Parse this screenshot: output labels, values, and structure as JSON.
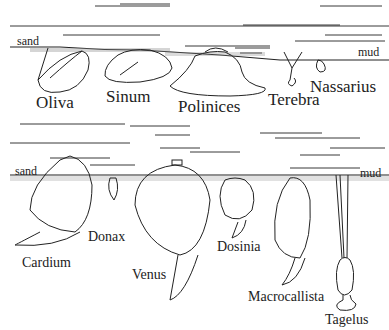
{
  "panels": [
    {
      "id": "top",
      "substrate_left": "sand",
      "substrate_right": "mud",
      "organisms": [
        {
          "name": "Oliva"
        },
        {
          "name": "Sinum"
        },
        {
          "name": "Polinices"
        },
        {
          "name": "Terebra"
        },
        {
          "name": "Nassarius"
        }
      ]
    },
    {
      "id": "bottom",
      "substrate_left": "sand",
      "substrate_right": "mud",
      "organisms": [
        {
          "name": "Cardium"
        },
        {
          "name": "Donax"
        },
        {
          "name": "Venus"
        },
        {
          "name": "Dosinia"
        },
        {
          "name": "Macrocallista"
        },
        {
          "name": "Tagelus"
        }
      ]
    }
  ],
  "colors": {
    "ink": "#222222",
    "background": "#ffffff"
  }
}
